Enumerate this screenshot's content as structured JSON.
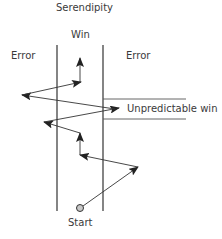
{
  "diagram": {
    "title": "Serendipity",
    "zones": {
      "center": "Win",
      "left": "Error",
      "right": "Error",
      "band": "Unpredictable win"
    },
    "start_label": "Start",
    "colors": {
      "line": "#333333",
      "text": "#3a3a3a",
      "start_fill": "#c8c8c8"
    },
    "path": [
      {
        "from": [
          80,
          208
        ],
        "to": [
          138,
          167
        ]
      },
      {
        "from": [
          138,
          167
        ],
        "to": [
          80,
          155
        ]
      },
      {
        "from": [
          80,
          155
        ],
        "to": [
          80,
          133
        ]
      },
      {
        "from": [
          80,
          133
        ],
        "to": [
          44,
          122
        ]
      },
      {
        "from": [
          44,
          122
        ],
        "to": [
          119,
          108
        ]
      },
      {
        "from": [
          103,
          110
        ],
        "to": [
          22,
          95
        ]
      },
      {
        "from": [
          22,
          95
        ],
        "to": [
          80,
          82
        ]
      },
      {
        "from": [
          80,
          82
        ],
        "to": [
          80,
          58
        ]
      }
    ]
  }
}
